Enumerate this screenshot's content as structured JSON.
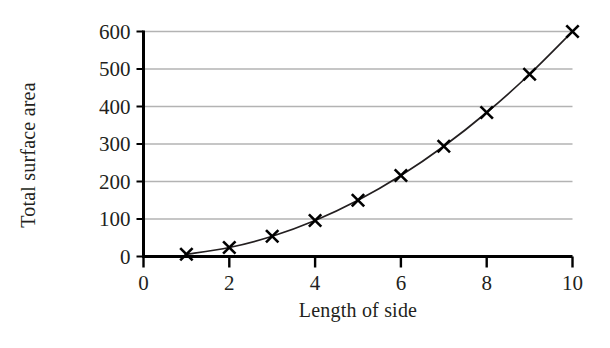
{
  "chart_data": {
    "type": "line",
    "title": "",
    "subtitle": "",
    "xlabel": "Length of side",
    "ylabel": "Total surface area",
    "x": [
      1,
      2,
      3,
      4,
      5,
      6,
      7,
      8,
      9,
      10
    ],
    "values": [
      6,
      24,
      54,
      96,
      150,
      216,
      294,
      384,
      486,
      600
    ],
    "series": [
      {
        "name": "Total surface area",
        "values": [
          6,
          24,
          54,
          96,
          150,
          216,
          294,
          384,
          486,
          600
        ]
      }
    ],
    "xlim": [
      0,
      10
    ],
    "ylim": [
      0,
      600
    ],
    "xticks": [
      0,
      2,
      4,
      6,
      8,
      10
    ],
    "xtick_labels": [
      "0",
      "2",
      "4",
      "6",
      "8",
      "10"
    ],
    "yticks": [
      0,
      100,
      200,
      300,
      400,
      500,
      600
    ],
    "ytick_labels": [
      "0",
      "100",
      "200",
      "300",
      "400",
      "500",
      "600"
    ],
    "grid": "horizontal",
    "legend": "none",
    "marker": "x",
    "line_color": "#231f20",
    "grid_color": "#b3b3b3",
    "axis_color": "#000000",
    "marker_color": "#000000",
    "background": "#ffffff"
  }
}
